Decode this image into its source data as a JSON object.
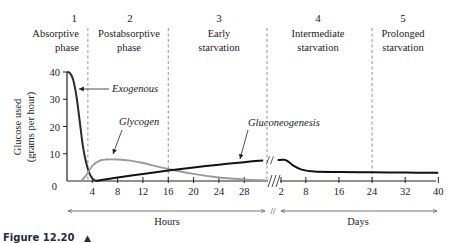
{
  "chart_data": {
    "type": "line",
    "title": "",
    "ylabel_lines": [
      "Glucose used",
      "(grams per hour)"
    ],
    "xlabel_hours": "Hours",
    "xlabel_days": "Days",
    "ylim": [
      0,
      40
    ],
    "yticks": [
      "0",
      "10",
      "20",
      "30",
      "40"
    ],
    "y_zero_label": "0",
    "hours_ticks": [
      4,
      8,
      12,
      16,
      20,
      24,
      28
    ],
    "hours_tick_labels": [
      "4",
      "8",
      "12",
      "16",
      "20",
      "24",
      "28"
    ],
    "days_ticks": [
      2,
      8,
      16,
      24,
      32,
      40
    ],
    "days_tick_labels": [
      "2",
      "8",
      "16",
      "24",
      "32",
      "40"
    ],
    "axis_break": "//",
    "phases": [
      {
        "number": "1",
        "lines": [
          "Absorptive",
          "phase"
        ]
      },
      {
        "number": "2",
        "lines": [
          "Postabsorptive",
          "phase"
        ]
      },
      {
        "number": "3",
        "lines": [
          "Early",
          "starvation"
        ]
      },
      {
        "number": "4",
        "lines": [
          "Intermediate",
          "starvation"
        ]
      },
      {
        "number": "5",
        "lines": [
          "Prolonged",
          "starvation"
        ]
      }
    ],
    "phase_boundaries": [
      {
        "unit": "hours",
        "x": 3.3
      },
      {
        "unit": "hours",
        "x": 16
      },
      {
        "unit": "break",
        "x": 31.5
      },
      {
        "unit": "days",
        "x": 24
      }
    ],
    "series": [
      {
        "name": "Exogenous",
        "color": "#2b2b2b",
        "unit": "hours",
        "points": [
          [
            0,
            40
          ],
          [
            0.5,
            39.5
          ],
          [
            1,
            37
          ],
          [
            1.5,
            31
          ],
          [
            2,
            22
          ],
          [
            2.5,
            13
          ],
          [
            3,
            7
          ],
          [
            3.5,
            3
          ],
          [
            4,
            1
          ],
          [
            4.5,
            0
          ]
        ]
      },
      {
        "name": "Glycogen",
        "color": "#9a9a9a",
        "unit": "hours",
        "points": [
          [
            2.2,
            0
          ],
          [
            3,
            2
          ],
          [
            4,
            5.5
          ],
          [
            5,
            7.3
          ],
          [
            6,
            7.9
          ],
          [
            8,
            7.9
          ],
          [
            10,
            7.5
          ],
          [
            12,
            6.6
          ],
          [
            16,
            4.4
          ],
          [
            20,
            2.6
          ],
          [
            24,
            1.3
          ],
          [
            28,
            0.6
          ],
          [
            31.5,
            0.2
          ]
        ]
      },
      {
        "name": "Gluconeogenesis",
        "color": "#111111",
        "unit": "mixed",
        "hours_points": [
          [
            4.5,
            0
          ],
          [
            8,
            1.3
          ],
          [
            12,
            2.6
          ],
          [
            16,
            3.8
          ],
          [
            20,
            5.0
          ],
          [
            24,
            6.0
          ],
          [
            28,
            6.9
          ],
          [
            31,
            7.5
          ]
        ],
        "days_points": [
          [
            1.2,
            7.7
          ],
          [
            2.5,
            7.8
          ],
          [
            3.5,
            7.4
          ],
          [
            5,
            5.6
          ],
          [
            7,
            4.2
          ],
          [
            10,
            3.5
          ],
          [
            16,
            3.3
          ],
          [
            24,
            3.2
          ],
          [
            32,
            3.1
          ],
          [
            40,
            3.0
          ]
        ]
      }
    ],
    "annotations": [
      {
        "text": "Exogenous",
        "series": "Exogenous"
      },
      {
        "text": "Glycogen",
        "series": "Glycogen"
      },
      {
        "text": "Gluconeogenesis",
        "series": "Gluconeogenesis"
      }
    ],
    "grid": false,
    "legend": "none"
  },
  "caption": {
    "label": "Figure 12.20",
    "triangle": "▲"
  }
}
